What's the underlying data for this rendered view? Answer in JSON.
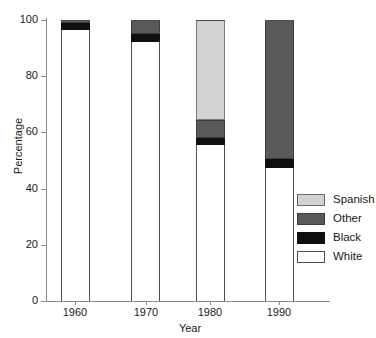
{
  "chart_data": {
    "type": "bar",
    "subtype": "stacked-bar",
    "title": "",
    "xlabel": "Year",
    "ylabel": "Percentage",
    "categories": [
      "1960",
      "1970",
      "1980",
      "1990"
    ],
    "ylim": [
      0,
      100
    ],
    "yticks": [
      0,
      20,
      40,
      60,
      80,
      100
    ],
    "ytick_labels": [
      "0",
      "20",
      "40",
      "60",
      "80",
      "100"
    ],
    "grid": false,
    "legend_position": "right-middle",
    "stack_order_bottom_to_top": [
      "White",
      "Black",
      "Other",
      "Spanish"
    ],
    "series": [
      {
        "name": "White",
        "color": "#ffffff",
        "values": [
          96.5,
          92.0,
          55.5,
          47.5
        ]
      },
      {
        "name": "Black",
        "color": "#101010",
        "values": [
          2.5,
          3.0,
          2.5,
          3.0
        ]
      },
      {
        "name": "Other",
        "color": "#595959",
        "values": [
          1.0,
          5.0,
          6.5,
          49.5
        ]
      },
      {
        "name": "Spanish",
        "color": "#d2d2d2",
        "values": [
          0.0,
          0.0,
          35.5,
          0.0
        ]
      }
    ]
  },
  "axes": {
    "y_title": "Percentage",
    "x_title": "Year",
    "y_tick_labels": [
      "100",
      "80",
      "60",
      "40",
      "20",
      "0"
    ],
    "x_tick_labels": [
      "1960",
      "1970",
      "1980",
      "1990"
    ]
  },
  "legend": {
    "items": [
      {
        "label": "Spanish",
        "swatch": "spanish"
      },
      {
        "label": "Other",
        "swatch": "other"
      },
      {
        "label": "Black",
        "swatch": "black"
      },
      {
        "label": "White",
        "swatch": "white"
      }
    ]
  },
  "colors": {
    "spanish": "#d2d2d2",
    "other": "#595959",
    "black": "#101010",
    "white": "#ffffff",
    "axis": "#8a8a8a",
    "outline": "#4d4d4d"
  }
}
